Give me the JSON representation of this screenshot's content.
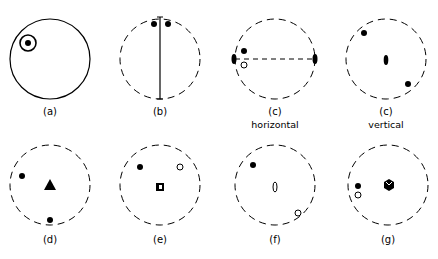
{
  "figure": {
    "panels": [
      {
        "id": "a",
        "label": "(a)",
        "sublabel": "",
        "circle": "solid",
        "description": "solid circle with encircled dot at upper-left"
      },
      {
        "id": "b",
        "label": "(b)",
        "sublabel": "",
        "circle": "dashed",
        "description": "vertical mirror line with two filled dots at top"
      },
      {
        "id": "c-horizontal",
        "label": "(c)",
        "sublabel": "horizontal",
        "circle": "dashed",
        "description": "horizontal 2-fold axis (dashed line with lens ends), filled dot above open circle"
      },
      {
        "id": "c-vertical",
        "label": "(c)",
        "sublabel": "vertical",
        "circle": "dashed",
        "description": "vertical 2-fold axis symbol at center, two filled dots opposite"
      },
      {
        "id": "d",
        "label": "(d)",
        "sublabel": "",
        "circle": "dashed",
        "description": "3-fold axis triangle at center, two filled dots"
      },
      {
        "id": "e",
        "label": "(e)",
        "sublabel": "",
        "circle": "dashed",
        "description": "4-bar rotoinversion square at center, filled dot and open circle"
      },
      {
        "id": "f",
        "label": "(f)",
        "sublabel": "",
        "circle": "dashed",
        "description": "open lens (inversion 2-fold) at center, filled dot and open circle opposite"
      },
      {
        "id": "g",
        "label": "(g)",
        "sublabel": "",
        "circle": "dashed",
        "description": "6-bar hexagon symbol at center, filled dot above open circle"
      }
    ]
  }
}
